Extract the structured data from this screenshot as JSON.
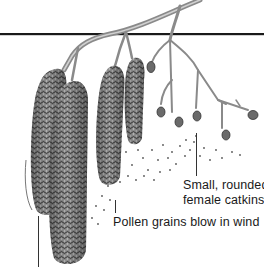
{
  "figure": {
    "colors": {
      "background": "#ffffff",
      "rule_line": "#1a1a1a",
      "branch": "#8a8a8a",
      "catkin_dark": "#3c3c3c",
      "catkin_mid": "#7a7a7a",
      "catkin_light": "#b5b5b5",
      "label_text": "#1a1a1a"
    },
    "labels": {
      "female_catkins_line1": "Small, rounded",
      "female_catkins_line2": "female catkins",
      "pollen": "Pollen grains blow in wind"
    },
    "icons": {
      "male_catkin": "male-catkin-icon",
      "female_catkin": "female-catkin-icon",
      "pollen": "pollen-grain-icon"
    }
  }
}
